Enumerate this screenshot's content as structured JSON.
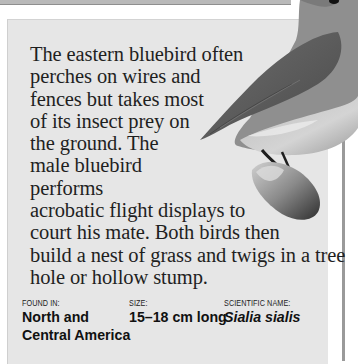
{
  "article": {
    "body_lines": [
      "The eastern bluebird often",
      "perches on wires and",
      "fences but takes most",
      "of its insect prey on",
      "the ground. The",
      "male bluebird",
      "performs",
      "acrobatic flight displays to",
      "court his mate. Both birds then",
      "build a nest of grass and twigs in a tree",
      "hole or hollow stump."
    ]
  },
  "facts": {
    "found_in": {
      "label": "FOUND IN:",
      "value_line1": "North and",
      "value_line2": "Central America"
    },
    "size": {
      "label": "SIZE:",
      "value": "15–18 cm long"
    },
    "scientific_name": {
      "label": "SCIENTIFIC NAME:",
      "value": "Sialia sialis"
    }
  },
  "image": {
    "subject": "eastern bluebird perched on branch stump"
  }
}
